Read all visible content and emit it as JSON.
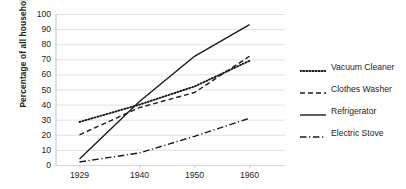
{
  "chart_data": {
    "type": "line",
    "title": "",
    "xlabel": "",
    "ylabel": "Percentage of all households",
    "x": [
      1929,
      1940,
      1950,
      1960
    ],
    "xtick_labels": [
      "1929",
      "1940",
      "1950",
      "1960"
    ],
    "ytick_labels": [
      "0",
      "10",
      "20",
      "30",
      "40",
      "50",
      "60",
      "70",
      "80",
      "90",
      "100"
    ],
    "ylim": [
      0,
      100
    ],
    "ytick_step": 10,
    "grid": "horizontal",
    "legend_position": "right",
    "series": [
      {
        "name": "Vacuum Cleaner",
        "style": "dotted",
        "color": "#1a1a1a",
        "values": [
          28.5,
          40.0,
          52.0,
          69.0
        ]
      },
      {
        "name": "Clothes Washer",
        "style": "dashed",
        "color": "#1a1a1a",
        "values": [
          20.0,
          38.0,
          48.0,
          72.0
        ]
      },
      {
        "name": "Refrigerator",
        "style": "solid",
        "color": "#1a1a1a",
        "values": [
          4.0,
          42.0,
          72.0,
          93.0
        ]
      },
      {
        "name": "Electric Stove",
        "style": "dash-dot",
        "color": "#1a1a1a",
        "values": [
          2.0,
          8.0,
          19.0,
          31.0
        ]
      }
    ]
  },
  "axes": {
    "y_title": "Percentage of all households",
    "y_ticks": [
      "100",
      "90",
      "80",
      "70",
      "60",
      "50",
      "40",
      "30",
      "20",
      "10",
      "0"
    ],
    "x_ticks": [
      "1929",
      "1940",
      "1950",
      "1960"
    ]
  },
  "legend": {
    "items": [
      {
        "label": "Vacuum Cleaner",
        "style": "dotted"
      },
      {
        "label": "Clothes Washer",
        "style": "dashed"
      },
      {
        "label": "Refrigerator",
        "style": "solid"
      },
      {
        "label": "Electric Stove",
        "style": "dash-dot"
      }
    ]
  },
  "colors": {
    "background": "#ffffff",
    "gridline": "#d9d9d9",
    "axis_line": "#bfbfbf",
    "line": "#1a1a1a",
    "text": "#1d1d1d"
  }
}
